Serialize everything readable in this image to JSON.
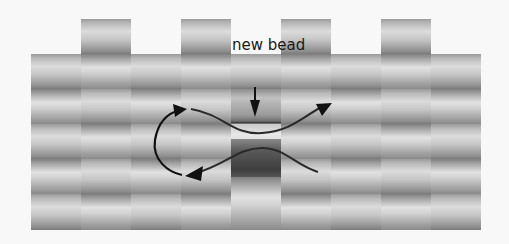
{
  "diagram": {
    "annotation": {
      "text": "new bead",
      "arrow": "down-arrow"
    },
    "background_color": "#f8f8f8",
    "bead_color_range": [
      "#7a7a7a",
      "#e2e2e2"
    ],
    "highlighted_bead_color": "#3e3e3e",
    "columns": [
      {
        "index": 1,
        "x": 31,
        "top": 54,
        "beads": 5
      },
      {
        "index": 2,
        "x": 81,
        "top": 19,
        "beads": 6
      },
      {
        "index": 3,
        "x": 131,
        "top": 54,
        "beads": 5
      },
      {
        "index": 4,
        "x": 181,
        "top": 19,
        "beads": 6
      },
      {
        "index": 5,
        "x": 231,
        "top": 54,
        "beads": 5,
        "new_bead_row": 2,
        "dark_bead_row": 3
      },
      {
        "index": 6,
        "x": 281,
        "top": 19,
        "beads": 6
      },
      {
        "index": 7,
        "x": 331,
        "top": 54,
        "beads": 5
      },
      {
        "index": 8,
        "x": 381,
        "top": 19,
        "beads": 6
      },
      {
        "index": 9,
        "x": 431,
        "top": 54,
        "beads": 5
      }
    ],
    "thread_paths": [
      {
        "name": "upper-thread",
        "direction": "right",
        "arrow": "arrow-right-icon"
      },
      {
        "name": "lower-thread",
        "direction": "left",
        "arrow": "arrow-left-icon"
      },
      {
        "name": "turn-loop",
        "direction": "up",
        "arrow": "arrow-up-right-icon"
      }
    ]
  }
}
